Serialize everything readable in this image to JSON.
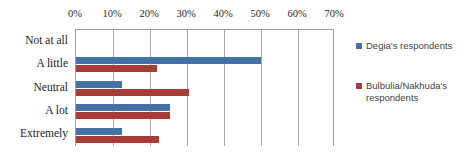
{
  "chart_data": {
    "type": "bar",
    "orientation": "horizontal",
    "title": "",
    "xlabel": "",
    "ylabel": "",
    "xlim": [
      0,
      70
    ],
    "xtick_labels": [
      "0%",
      "10%",
      "20%",
      "30%",
      "40%",
      "50%",
      "60%",
      "70%"
    ],
    "xticks": [
      0,
      10,
      20,
      30,
      40,
      50,
      60,
      70
    ],
    "grid": true,
    "legend_position": "right",
    "categories": [
      "Not at all",
      "A little",
      "Neutral",
      "A lot",
      "Extremely"
    ],
    "series": [
      {
        "name": "Degia's respondents",
        "color": "#4472a4",
        "values": [
          0,
          50,
          12.5,
          25.5,
          12.5
        ]
      },
      {
        "name": "Bulbulia/Nakhuda's respondents",
        "color": "#a83c36",
        "values": [
          0,
          22,
          30.5,
          25.5,
          22.5
        ]
      }
    ]
  },
  "legend": {
    "entries": [
      {
        "label": "Degia's respondents"
      },
      {
        "label": "Bulbulia/Nakhuda's respondents"
      }
    ]
  }
}
